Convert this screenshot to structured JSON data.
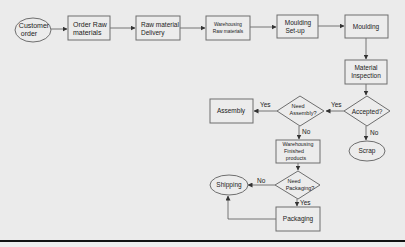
{
  "diagram": {
    "type": "flowchart",
    "nodes": {
      "customer_order": {
        "shape": "ellipse",
        "lines": [
          "Customer",
          "order"
        ]
      },
      "order_raw": {
        "shape": "rect",
        "lines": [
          "Order Raw",
          "materials"
        ]
      },
      "raw_delivery": {
        "shape": "rect",
        "lines": [
          "Raw material",
          "Delivery"
        ]
      },
      "wh_raw": {
        "shape": "rect",
        "lines": [
          "Warehousing",
          "Raw materials"
        ]
      },
      "moulding_setup": {
        "shape": "rect",
        "lines": [
          "Moulding",
          "Set-up"
        ]
      },
      "moulding": {
        "shape": "rect",
        "lines": [
          "Moulding"
        ]
      },
      "inspection": {
        "shape": "rect",
        "lines": [
          "Material",
          "Inspection"
        ]
      },
      "accepted": {
        "shape": "diamond",
        "lines": [
          "Accepted?"
        ]
      },
      "need_assembly": {
        "shape": "diamond",
        "lines": [
          "Need",
          "Assembly?"
        ]
      },
      "assembly": {
        "shape": "rect",
        "lines": [
          "Assembly"
        ]
      },
      "scrap": {
        "shape": "ellipse",
        "lines": [
          "Scrap"
        ]
      },
      "wh_finished": {
        "shape": "rect",
        "lines": [
          "Warehousing",
          "Finished",
          "products"
        ]
      },
      "need_packaging": {
        "shape": "diamond",
        "lines": [
          "Need",
          "Packaging?"
        ]
      },
      "shipping": {
        "shape": "ellipse",
        "lines": [
          "Shipping"
        ]
      },
      "packaging": {
        "shape": "rect",
        "lines": [
          "Packaging"
        ]
      }
    },
    "edge_labels": {
      "accepted_yes": "Yes",
      "accepted_no": "No",
      "assembly_yes": "Yes",
      "assembly_no": "No",
      "packaging_no": "No",
      "packaging_yes": "Yes"
    },
    "edges": [
      [
        "customer_order",
        "order_raw",
        ""
      ],
      [
        "order_raw",
        "raw_delivery",
        ""
      ],
      [
        "raw_delivery",
        "wh_raw",
        ""
      ],
      [
        "wh_raw",
        "moulding_setup",
        ""
      ],
      [
        "moulding_setup",
        "moulding",
        ""
      ],
      [
        "moulding",
        "inspection",
        ""
      ],
      [
        "inspection",
        "accepted",
        ""
      ],
      [
        "accepted",
        "need_assembly",
        "Yes"
      ],
      [
        "accepted",
        "scrap",
        "No"
      ],
      [
        "need_assembly",
        "assembly",
        "Yes"
      ],
      [
        "need_assembly",
        "wh_finished",
        "No"
      ],
      [
        "wh_finished",
        "need_packaging",
        ""
      ],
      [
        "need_packaging",
        "shipping",
        "No"
      ],
      [
        "need_packaging",
        "packaging",
        "Yes"
      ],
      [
        "packaging",
        "shipping",
        ""
      ]
    ]
  }
}
